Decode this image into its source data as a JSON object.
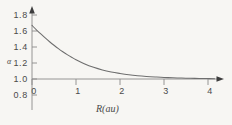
{
  "chart_data": {
    "type": "line",
    "title": "",
    "subtitle": "",
    "xlabel": "R(au)",
    "ylabel": "α",
    "xlim": [
      -0.15,
      4.25
    ],
    "ylim": [
      0.8,
      1.85
    ],
    "xticks": [
      0,
      1,
      2,
      3,
      4
    ],
    "xtick_labels": [
      "0",
      "1",
      "2",
      "3",
      "4"
    ],
    "yticks": [
      0.8,
      1.0,
      1.2,
      1.4,
      1.6,
      1.8
    ],
    "ytick_labels": [
      "0.8",
      "1.0",
      "1.2",
      "1.4",
      "1.6",
      "1.8"
    ],
    "grid": false,
    "legend": "none",
    "axis_arrows": true,
    "x_axis_at_y": 1.0,
    "line_color": "#6e6e6e",
    "series": [
      {
        "name": "alpha",
        "x": [
          0.0,
          0.1,
          0.2,
          0.3,
          0.4,
          0.5,
          0.6,
          0.7,
          0.8,
          0.9,
          1.0,
          1.2,
          1.4,
          1.6,
          1.8,
          2.0,
          2.2,
          2.4,
          2.6,
          2.8,
          3.0,
          3.2,
          3.4,
          3.6,
          3.8,
          4.0,
          4.15
        ],
        "values": [
          1.67,
          1.615,
          1.563,
          1.513,
          1.466,
          1.422,
          1.38,
          1.341,
          1.305,
          1.272,
          1.241,
          1.188,
          1.146,
          1.113,
          1.088,
          1.069,
          1.053,
          1.041,
          1.032,
          1.025,
          1.019,
          1.015,
          1.012,
          1.009,
          1.007,
          1.005,
          1.004
        ]
      }
    ]
  },
  "axis_labels": {
    "x_title": "R(au)",
    "y_title": "α"
  },
  "colors": {
    "background": "#f7f6f3",
    "axis": "#8a8a8a",
    "curve": "#6e6e6e",
    "text": "#4a4a4a"
  }
}
